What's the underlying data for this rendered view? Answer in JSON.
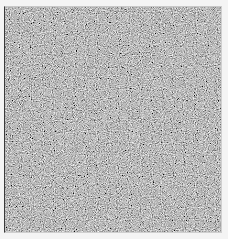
{
  "image": {
    "kind": "grayscale-noise-texture",
    "base_color": "#878787",
    "light_speckle_color": "#c4c4c4",
    "dark_speckle_color": "#3e3e3e",
    "margin_color": "#f4f4f4",
    "left_edge_color": "#3a3a3a"
  }
}
